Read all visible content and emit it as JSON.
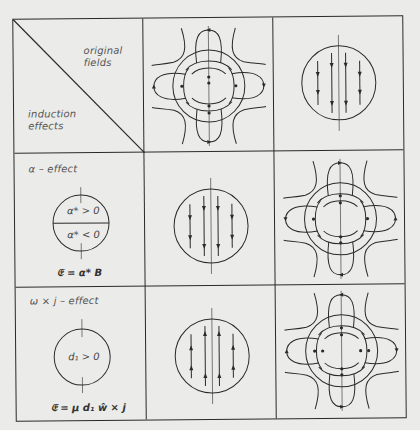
{
  "header_cell": {
    "top_label_line1": "original",
    "top_label_line2": "fields",
    "bottom_label_line1": "induction",
    "bottom_label_line2": "effects"
  },
  "columns": [
    {
      "id": "quadrupole",
      "description": "poloidal quadrupole-like field with four loops around a circle, arrows on field lines"
    },
    {
      "id": "uniform",
      "description": "circle with four parallel vertical field lines, arrows pointing downward"
    }
  ],
  "rows": [
    {
      "title": "α – effect",
      "regions": [
        "α* > 0",
        "α* < 0"
      ],
      "formula": "𝔈 = α* B",
      "cells": [
        {
          "pattern": "uniform",
          "arrow_direction": "down"
        },
        {
          "pattern": "quadrupole",
          "arrow_direction": "mixed"
        }
      ]
    },
    {
      "title": "ω × j – effect",
      "regions": [
        "d₁ > 0"
      ],
      "formula": "𝔈 = μ d₁ ŵ × j",
      "cells": [
        {
          "pattern": "uniform",
          "arrow_direction": "up"
        },
        {
          "pattern": "quadrupole",
          "arrow_direction": "mixed"
        }
      ]
    }
  ],
  "colors": {
    "background": "#ebebe9",
    "ink": "#2a2a2a",
    "label": "#555555"
  }
}
